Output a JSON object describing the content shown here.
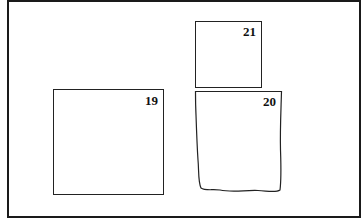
{
  "diagram": {
    "boxes": [
      {
        "id": "box-21",
        "label": "21",
        "shape": "rectangle"
      },
      {
        "id": "box-19",
        "label": "19",
        "shape": "rectangle"
      },
      {
        "id": "box-20",
        "label": "20",
        "shape": "hand-drawn rectangle"
      }
    ]
  }
}
